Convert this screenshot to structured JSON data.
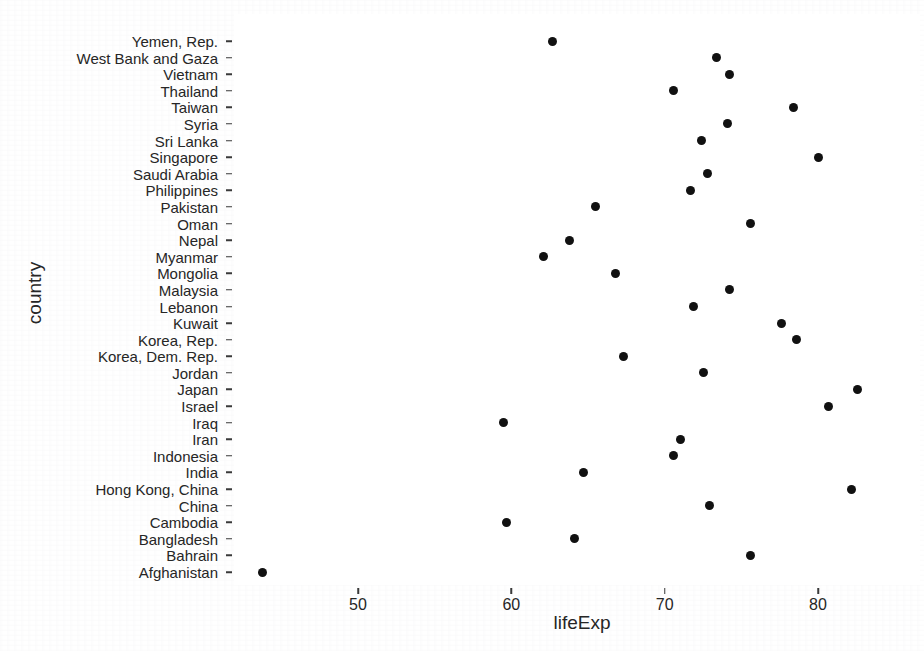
{
  "chart_data": {
    "type": "scatter",
    "title": "",
    "xlabel": "lifeExp",
    "ylabel": "country",
    "grid": false,
    "legend": "none",
    "xlim": [
      43.0,
      83.5
    ],
    "xticks": [
      50,
      60,
      70,
      80
    ],
    "xtick_labels": [
      "50",
      "60",
      "70",
      "80"
    ],
    "categories": [
      "Yemen, Rep.",
      "West Bank and Gaza",
      "Vietnam",
      "Thailand",
      "Taiwan",
      "Syria",
      "Sri Lanka",
      "Singapore",
      "Saudi Arabia",
      "Philippines",
      "Pakistan",
      "Oman",
      "Nepal",
      "Myanmar",
      "Mongolia",
      "Malaysia",
      "Lebanon",
      "Kuwait",
      "Korea, Rep.",
      "Korea, Dem. Rep.",
      "Jordan",
      "Japan",
      "Israel",
      "Iraq",
      "Iran",
      "Indonesia",
      "India",
      "Hong Kong, China",
      "China",
      "Cambodia",
      "Bangladesh",
      "Bahrain",
      "Afghanistan"
    ],
    "values": [
      62.7,
      73.4,
      74.2,
      70.6,
      78.4,
      74.1,
      72.4,
      80.0,
      72.8,
      71.7,
      65.5,
      75.6,
      63.8,
      62.1,
      66.8,
      74.2,
      71.9,
      77.6,
      78.6,
      67.3,
      72.5,
      82.6,
      80.7,
      59.5,
      71.0,
      70.6,
      64.7,
      82.2,
      72.9,
      59.7,
      64.1,
      75.6,
      43.8
    ],
    "point_color": "#111111",
    "panel_background": "#ffffff"
  }
}
